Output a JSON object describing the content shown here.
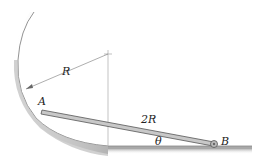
{
  "diagram": {
    "labels": {
      "radius": "R",
      "rod_length": "2R",
      "point_a": "A",
      "point_b": "B",
      "angle": "θ"
    },
    "colors": {
      "surface_shade": "#9a9a9a",
      "rod_fill": "#c8c8c8",
      "rod_edge": "#555555",
      "line": "#666666"
    }
  }
}
